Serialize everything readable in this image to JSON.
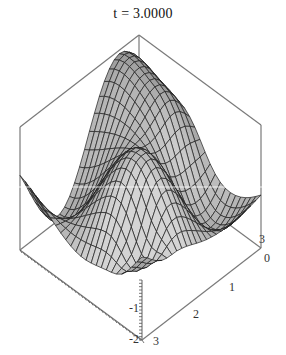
{
  "title": "t = 3.0000",
  "chart_data": {
    "type": "surface3d",
    "title": "t = 3.0000",
    "parameter": {
      "name": "t",
      "value": 3.0
    },
    "xlabel": "",
    "ylabel": "",
    "zlabel": "",
    "x_range": [
      0,
      3
    ],
    "y_range": [
      0,
      3
    ],
    "z_range": [
      -2,
      2
    ],
    "x_ticks": [
      "0",
      "1",
      "2",
      "3"
    ],
    "y_ticks": [
      "3"
    ],
    "z_ticks": [
      "-2",
      "-1"
    ],
    "grid_mesh": true,
    "shading": "grayscale",
    "box": true,
    "mesh_resolution": 24,
    "surface_description": "Oscillating surface with two tall back peaks, a light central ridge and a deep front valley"
  },
  "axes": {
    "z_labels": [
      {
        "text": "-2",
        "x": 134,
        "y": 343
      },
      {
        "text": "-1",
        "x": 134,
        "y": 312
      }
    ],
    "x_labels": [
      {
        "text": "3",
        "x": 156,
        "y": 345
      },
      {
        "text": "2",
        "x": 196,
        "y": 318
      },
      {
        "text": "1",
        "x": 232,
        "y": 291
      },
      {
        "text": "0",
        "x": 267,
        "y": 262
      }
    ],
    "y_labels": [
      {
        "text": "3",
        "x": 262,
        "y": 243
      }
    ]
  },
  "colors": {
    "box_line": "#7a7a7a",
    "mesh_line": "#1e1e1e",
    "surface_dark": "#4a4a4a",
    "surface_light": "#d4d4d4",
    "background": "#ffffff"
  }
}
